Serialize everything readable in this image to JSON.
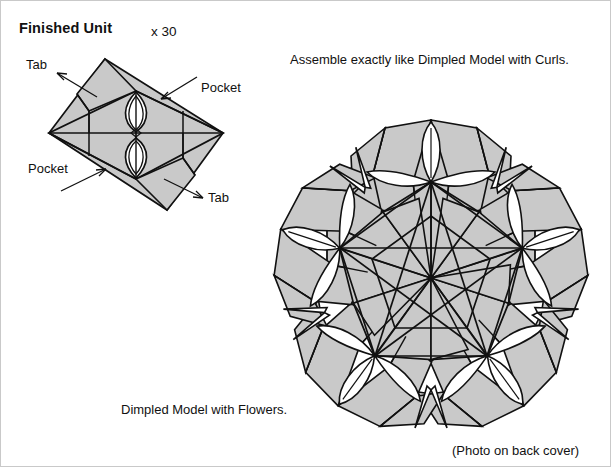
{
  "document": {
    "kind": "origami-instruction-diagram",
    "background_color": "#ffffff",
    "ink_color": "#111111",
    "paper_fill_color": "#c9c9c9",
    "highlight_fill_color": "#ffffff"
  },
  "unit_panel": {
    "title": "Finished Unit",
    "multiplier": "x 30",
    "labels": {
      "tab_top": "Tab",
      "pocket_top": "Pocket",
      "pocket_bottom": "Pocket",
      "tab_bottom": "Tab"
    },
    "icon_names": {
      "tab_top_arrow": "arrow-up-left-icon",
      "pocket_top_arrow": "arrow-down-left-icon",
      "pocket_bottom_arrow": "arrow-up-right-icon",
      "tab_bottom_arrow": "arrow-down-right-icon"
    }
  },
  "model_panel": {
    "assembly_note": "Assemble exactly like Dimpled Model with Curls.",
    "caption": "Dimpled Model with Flowers.",
    "photo_note": "(Photo on back cover)",
    "symmetry_fold": 5,
    "unit_count": 30
  }
}
